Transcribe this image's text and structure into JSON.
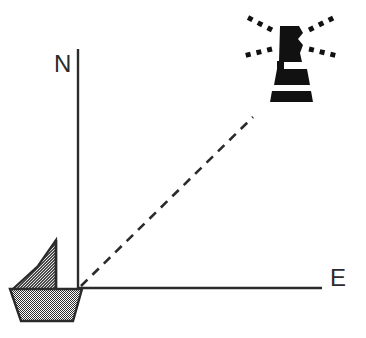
{
  "figure": {
    "width": 366,
    "height": 338,
    "background_color": "#ffffff",
    "ink_color": "#2b2b2b",
    "solid_black": "#111111"
  },
  "axes": {
    "north_label": "N",
    "east_label": "E",
    "origin": {
      "x": 78,
      "y": 288
    },
    "vertical_axis": {
      "x": 78,
      "y_top": 49,
      "y_bottom": 288,
      "stroke_width": 2.4
    },
    "horizontal_axis": {
      "y": 288,
      "x_left": 78,
      "x_right": 322,
      "stroke_width": 2.4
    }
  },
  "bearing_line": {
    "name": "bearing-sight-line",
    "style": "dashed",
    "from": {
      "x": 80,
      "y": 287
    },
    "to": {
      "x": 253,
      "y": 117
    },
    "stroke_width": 2.6,
    "dash_pattern": "9 7",
    "color": "#2b2b2b"
  },
  "boat": {
    "name": "sailboat",
    "sail": {
      "points": "56,240 56,289 14,289 40,265",
      "fill_tone": "dark-dither",
      "fill_color": "#6f6f6f",
      "outline_color": "#2b2b2b"
    },
    "hull": {
      "points": "11,289 82,289 73,320 21,320",
      "fill_tone": "medium-dither",
      "fill_color": "#9a9a9a",
      "outline_color": "#2b2b2b"
    },
    "mast": {
      "x": 56,
      "y_top": 240,
      "y_bottom": 290,
      "color": "#2b2b2b"
    }
  },
  "lighthouse": {
    "name": "lighthouse",
    "lamp_house": {
      "points": "280,26 300,26 303,38 299,44 303,50 300,62 280,62",
      "fill_color": "#111111"
    },
    "tower_band": {
      "points": "276,69 306,69 309,84 273,84",
      "fill_color": "#111111"
    },
    "base_band": {
      "points": "272,90 310,90 312,101 270,101",
      "fill_color": "#111111"
    },
    "neck": {
      "x": 277,
      "y": 62,
      "width": 6,
      "height": 8,
      "fill_color": "#111111"
    },
    "rays": [
      {
        "name": "ray-upper-left",
        "x1": 272,
        "y1": 30,
        "x2": 245,
        "y2": 16
      },
      {
        "name": "ray-lower-left",
        "x1": 272,
        "y1": 48,
        "x2": 243,
        "y2": 55
      },
      {
        "name": "ray-upper-right",
        "x1": 309,
        "y1": 30,
        "x2": 337,
        "y2": 16
      },
      {
        "name": "ray-lower-right",
        "x1": 309,
        "y1": 48,
        "x2": 338,
        "y2": 55
      }
    ],
    "ray_style": {
      "stroke_width": 5,
      "dash_pattern": "5 6",
      "color": "#111111",
      "linecap": "butt"
    }
  }
}
